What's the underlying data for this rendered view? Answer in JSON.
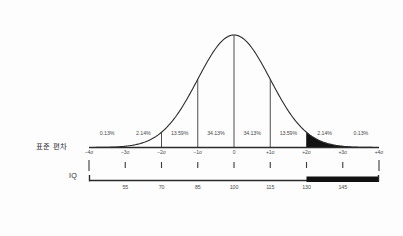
{
  "figure": {
    "background_color": "#fdfdfd",
    "ink_color": "#3a3a3a",
    "fill_color": "#111111"
  },
  "axes": {
    "sd_axis_name": "표준 편차",
    "iq_axis_name": "IQ"
  },
  "chart_data": {
    "type": "area",
    "title": "",
    "subtitle": "",
    "xlabel": "표준 편차",
    "ylabel": "",
    "x": [
      -4,
      -3,
      -2,
      -1,
      0,
      1,
      2,
      3,
      4
    ],
    "xtick_labels": [
      "−4σ",
      "−3σ",
      "−2σ",
      "−1σ",
      "0",
      "+1σ",
      "+2σ",
      "+3σ",
      "+4σ"
    ],
    "secondary_axis": {
      "label": "IQ",
      "x": [
        -3,
        -2,
        -1,
        0,
        1,
        2,
        3
      ],
      "tick_labels": [
        "55",
        "70",
        "85",
        "100",
        "115",
        "130",
        "145"
      ]
    },
    "band_percentages": [
      "0.13%",
      "2.14%",
      "13.59%",
      "34.13%",
      "34.13%",
      "13.59%",
      "2.14%",
      "0.13%"
    ],
    "band_ranges": [
      "-4σ to -3σ",
      "-3σ to -2σ",
      "-2σ to -1σ",
      "-1σ to 0",
      "0 to +1σ",
      "+1σ to +2σ",
      "+2σ to +3σ",
      "+3σ to +4σ"
    ],
    "shaded_region": {
      "from": "+2σ",
      "to": "+4σ",
      "color": "#111111"
    },
    "xlim": [
      -4,
      4
    ],
    "ylim": [
      0,
      1
    ],
    "grid": false,
    "legend": "none",
    "annotations": [
      "Normal distribution curve with vertical dropline markers at -2σ, -1σ, 0, +1σ, +2σ",
      "Right tail beyond +2σ shaded solid black",
      "IQ bar segment from 130 upward shaded solid black"
    ]
  },
  "percent_labels": [
    {
      "text": "0.13%",
      "x": -3.5
    },
    {
      "text": "2.14%",
      "x": -2.5
    },
    {
      "text": "13.59%",
      "x": -1.5
    },
    {
      "text": "34.13%",
      "x": -0.5
    },
    {
      "text": "34.13%",
      "x": 0.5
    },
    {
      "text": "13.59%",
      "x": 1.5
    },
    {
      "text": "2.14%",
      "x": 2.5
    },
    {
      "text": "0.13%",
      "x": 3.5
    }
  ],
  "sigma_labels": [
    {
      "text": "−4σ",
      "x": -4
    },
    {
      "text": "−3σ",
      "x": -3
    },
    {
      "text": "−2σ",
      "x": -2
    },
    {
      "text": "−1σ",
      "x": -1
    },
    {
      "text": "0",
      "x": 0
    },
    {
      "text": "+1σ",
      "x": 1
    },
    {
      "text": "+2σ",
      "x": 2
    },
    {
      "text": "+3σ",
      "x": 3
    },
    {
      "text": "+4σ",
      "x": 4
    }
  ],
  "iq_labels": [
    {
      "text": "55",
      "x": -3
    },
    {
      "text": "70",
      "x": -2
    },
    {
      "text": "85",
      "x": -1
    },
    {
      "text": "100",
      "x": 0
    },
    {
      "text": "115",
      "x": 1
    },
    {
      "text": "130",
      "x": 2
    },
    {
      "text": "145",
      "x": 3
    }
  ]
}
